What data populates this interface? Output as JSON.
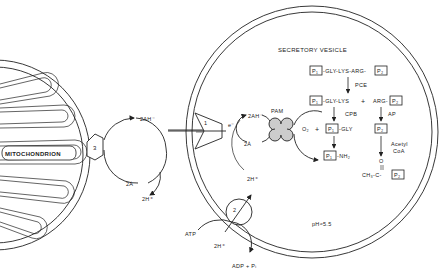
{
  "diagram": {
    "mitochondrion": {
      "label": "MITOCHONDRION"
    },
    "secretory_vesicle": {
      "label": "SECRETORY VESICLE",
      "ph_label": "pH≈5.5"
    },
    "transporters": [
      {
        "id": "1",
        "label": "1"
      },
      {
        "id": "2",
        "label": "2"
      },
      {
        "id": "3",
        "label": "3"
      }
    ],
    "left_cycle": {
      "top": "2AH⁻",
      "bottom": "2Ȧ",
      "proton": "2H⁺"
    },
    "right_cycle": {
      "electron": "e⁻",
      "top": "2AH⁻",
      "bottom": "2Ȧ"
    },
    "enzyme": {
      "label": "PAM"
    },
    "pump": {
      "atp": "ATP",
      "adp": "ADP + Pᵢ",
      "proton_in": "2H⁺",
      "proton_out": "2H⁺"
    },
    "pathway": {
      "precursor": {
        "p1": "P₁",
        "chain": "-GLY-LYS-ARG-",
        "p2": "P₂"
      },
      "step1_enzyme": "PCE",
      "intermediate": {
        "p1": "P₁",
        "chain": "-GLY-LYS",
        "plus": "+",
        "arg": "ARG-",
        "p2": "P₂"
      },
      "step2_enzyme_left": "CPB",
      "step2_enzyme_right": "AP",
      "o2": "O₂",
      "plus": "+",
      "glycine_ext": {
        "p1": "P₁",
        "chain": "-GLY"
      },
      "p2_free": "P₂",
      "acetyl_label_1": "Acetyl",
      "acetyl_label_2": "CoA",
      "amide": {
        "p1": "P₁",
        "chain": "-NH₂"
      },
      "acetylated": {
        "prefix": "CH₃-C-",
        "o": "O",
        "p2": "P₂"
      }
    }
  }
}
